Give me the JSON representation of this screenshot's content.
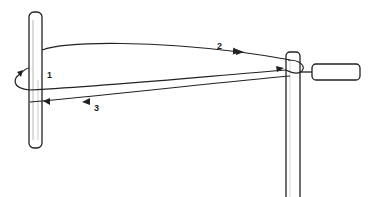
{
  "diagram": {
    "type": "rope-wrapping-illustration",
    "elements": {
      "left_post": {
        "description": "vertical post on left"
      },
      "right_post": {
        "description": "vertical post on right with horizontal handle"
      },
      "handle": {
        "description": "horizontal cylindrical handle attached to right post"
      }
    },
    "labels": {
      "step1": "1",
      "step2": "2",
      "step3": "3"
    },
    "colors": {
      "stroke": "#222222",
      "background": "#ffffff"
    }
  }
}
